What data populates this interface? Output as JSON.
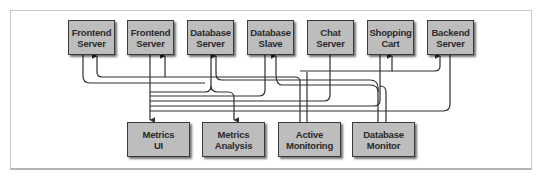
{
  "diagram": {
    "colors": {
      "node_fill": "#bdbdbd",
      "node_border": "#3a3a3a",
      "wire": "#2e2e2e",
      "frame": "#c9c9c9"
    },
    "top_nodes": [
      {
        "id": "frontend1",
        "label": "Frontend\nServer",
        "x": 68,
        "y": 20,
        "w": 47,
        "h": 35
      },
      {
        "id": "frontend2",
        "label": "Frontend\nServer",
        "x": 127,
        "y": 20,
        "w": 47,
        "h": 35
      },
      {
        "id": "dbserver",
        "label": "Database\nServer",
        "x": 187,
        "y": 20,
        "w": 47,
        "h": 35
      },
      {
        "id": "dbslave",
        "label": "Database\nSlave",
        "x": 247,
        "y": 20,
        "w": 47,
        "h": 35
      },
      {
        "id": "chat",
        "label": "Chat\nServer",
        "x": 307,
        "y": 20,
        "w": 47,
        "h": 35
      },
      {
        "id": "cart",
        "label": "Shopping\nCart",
        "x": 367,
        "y": 20,
        "w": 47,
        "h": 35
      },
      {
        "id": "backend",
        "label": "Backend\nServer",
        "x": 427,
        "y": 20,
        "w": 47,
        "h": 35
      }
    ],
    "bottom_nodes": [
      {
        "id": "metricsui",
        "label": "Metrics\nUI",
        "x": 127,
        "y": 122,
        "w": 63,
        "h": 35
      },
      {
        "id": "metricsanalysis",
        "label": "Metrics\nAnalysis",
        "x": 202,
        "y": 122,
        "w": 63,
        "h": 35
      },
      {
        "id": "activemon",
        "label": "Active\nMonitoring",
        "x": 278,
        "y": 122,
        "w": 63,
        "h": 35
      },
      {
        "id": "dbmon",
        "label": "Database\nMonitor",
        "x": 352,
        "y": 122,
        "w": 63,
        "h": 35
      }
    ],
    "edges": [
      {
        "from": "frontend1",
        "to": "metricsui",
        "desc": "metrics feed"
      },
      {
        "from": "frontend2",
        "to": "metricsui",
        "desc": "metrics feed"
      },
      {
        "from": "dbserver",
        "to": "metricsui",
        "desc": "metrics feed"
      },
      {
        "from": "dbslave",
        "to": "metricsui",
        "desc": "metrics feed"
      },
      {
        "from": "cart",
        "to": "metricsui",
        "desc": "metrics feed"
      },
      {
        "from": "backend",
        "to": "metricsui",
        "desc": "metrics feed"
      },
      {
        "from": "chat",
        "to": "metricsanalysis",
        "desc": "metrics feed"
      },
      {
        "from": "activemon",
        "to": "frontend1",
        "desc": "health check"
      },
      {
        "from": "activemon",
        "to": "frontend2",
        "desc": "health check"
      },
      {
        "from": "activemon",
        "to": "cart",
        "desc": "health check"
      },
      {
        "from": "activemon",
        "to": "backend",
        "desc": "health check"
      },
      {
        "from": "dbmon",
        "to": "dbserver",
        "desc": "db check"
      },
      {
        "from": "dbmon",
        "to": "dbslave",
        "desc": "db check"
      }
    ]
  }
}
